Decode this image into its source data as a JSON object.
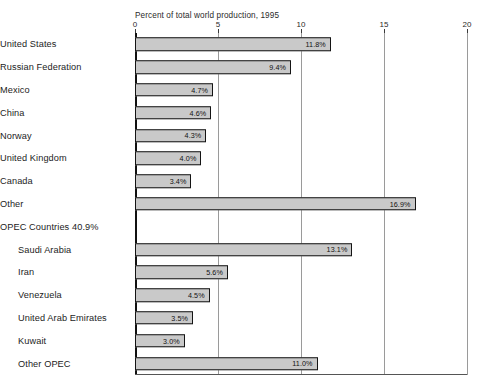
{
  "chart_data": {
    "type": "bar",
    "orientation": "horizontal",
    "title": "Percent of total world production, 1995",
    "xlabel": "",
    "ylabel": "",
    "xlim": [
      0,
      20
    ],
    "xticks": [
      0,
      5,
      10,
      15,
      20
    ],
    "xtick_labels": [
      "0",
      "5",
      "10",
      "15",
      "20"
    ],
    "grid": true,
    "legend": "none",
    "value_suffix": "%",
    "categories": [
      "United States",
      "Russian Federation",
      "Mexico",
      "China",
      "Norway",
      "United Kingdom",
      "Canada",
      "Other",
      "OPEC Countries 40.9%",
      "Saudi Arabia",
      "Iran",
      "Venezuela",
      "United Arab Emirates",
      "Kuwait",
      "Other OPEC"
    ],
    "values": [
      11.8,
      9.4,
      4.7,
      4.6,
      4.3,
      4.0,
      3.4,
      16.9,
      null,
      13.1,
      5.6,
      4.5,
      3.5,
      3.0,
      11.0
    ],
    "data_labels": [
      "11.8%",
      "9.4%",
      "4.7%",
      "4.6%",
      "4.3%",
      "4.0%",
      "3.4%",
      "16.9%",
      "",
      "13.1%",
      "5.6%",
      "4.5%",
      "3.5%",
      "3.0%",
      "11.0%"
    ],
    "rows": [
      {
        "label": "United States",
        "value": 11.8,
        "data_label": "11.8%",
        "indent": false,
        "is_heading": false
      },
      {
        "label": "Russian Federation",
        "value": 9.4,
        "data_label": "9.4%",
        "indent": false,
        "is_heading": false
      },
      {
        "label": "Mexico",
        "value": 4.7,
        "data_label": "4.7%",
        "indent": false,
        "is_heading": false
      },
      {
        "label": "China",
        "value": 4.6,
        "data_label": "4.6%",
        "indent": false,
        "is_heading": false
      },
      {
        "label": "Norway",
        "value": 4.3,
        "data_label": "4.3%",
        "indent": false,
        "is_heading": false
      },
      {
        "label": "United Kingdom",
        "value": 4.0,
        "data_label": "4.0%",
        "indent": false,
        "is_heading": false
      },
      {
        "label": "Canada",
        "value": 3.4,
        "data_label": "3.4%",
        "indent": false,
        "is_heading": false
      },
      {
        "label": "Other",
        "value": 16.9,
        "data_label": "16.9%",
        "indent": false,
        "is_heading": false
      },
      {
        "label": "OPEC Countries 40.9%",
        "value": null,
        "data_label": "",
        "indent": false,
        "is_heading": true
      },
      {
        "label": "Saudi Arabia",
        "value": 13.1,
        "data_label": "13.1%",
        "indent": true,
        "is_heading": false
      },
      {
        "label": "Iran",
        "value": 5.6,
        "data_label": "5.6%",
        "indent": true,
        "is_heading": false
      },
      {
        "label": "Venezuela",
        "value": 4.5,
        "data_label": "4.5%",
        "indent": true,
        "is_heading": false
      },
      {
        "label": "United Arab Emirates",
        "value": 3.5,
        "data_label": "3.5%",
        "indent": true,
        "is_heading": false
      },
      {
        "label": "Kuwait",
        "value": 3.0,
        "data_label": "3.0%",
        "indent": true,
        "is_heading": false
      },
      {
        "label": "Other OPEC",
        "value": 11.0,
        "data_label": "11.0%",
        "indent": true,
        "is_heading": false
      }
    ],
    "colors": {
      "bar_fill": "#c9c9c9",
      "bar_outline": "#141414",
      "gridline": "#9a9a9a",
      "axis": "#111111",
      "text": "#1c1c1c",
      "background": "#ffffff"
    }
  }
}
